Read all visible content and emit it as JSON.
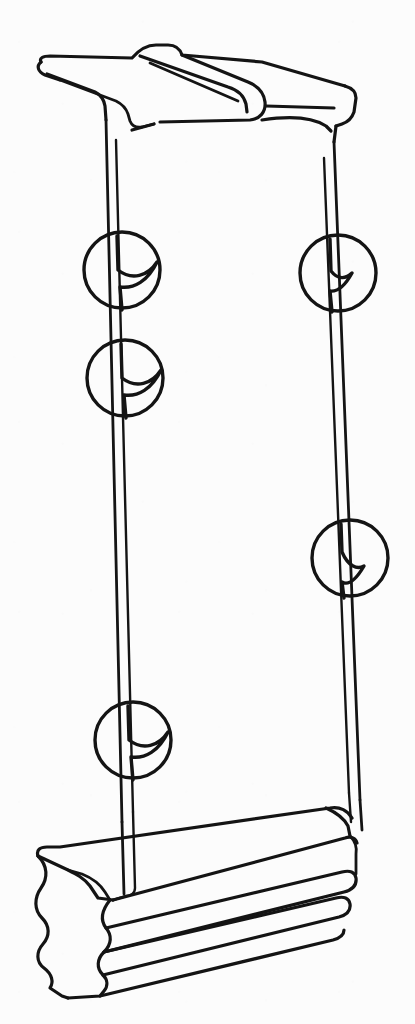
{
  "document": {
    "type": "technical-line-drawing",
    "subject": "architectural column pilaster",
    "title": "",
    "caption": "",
    "background_color": "#fcfcfc",
    "ink_color": "#141414",
    "width_px": 415,
    "height_px": 1024,
    "has_text_labels": false,
    "has_dimensions": false
  },
  "figure": {
    "name": "column-pilaster-perspective",
    "view": "three-quarter perspective",
    "parts": [
      {
        "id": "capital",
        "label": "capital",
        "description": "crown molding top with scrolled roll and projecting abacus",
        "region": {
          "x": 35,
          "y": 42,
          "width": 325,
          "height": 95
        }
      },
      {
        "id": "shaft",
        "label": "shaft",
        "description": "tall plain column shaft with two visible vertical arrises per side",
        "region": {
          "x": 100,
          "y": 120,
          "width": 260,
          "height": 700
        }
      },
      {
        "id": "base",
        "label": "base",
        "description": "stepped plinth base with ogee wavy side profile and three stacked courses",
        "region": {
          "x": 45,
          "y": 815,
          "width": 340,
          "height": 175
        }
      }
    ],
    "break_symbols": [
      {
        "id": "break-upper-left",
        "side": "left",
        "cx": 122,
        "cy": 270,
        "r": 38,
        "orientation": "s-curve-right"
      },
      {
        "id": "break-mid-left",
        "side": "left",
        "cx": 125,
        "cy": 378,
        "r": 38,
        "orientation": "s-curve-right"
      },
      {
        "id": "break-upper-right",
        "side": "right",
        "cx": 338,
        "cy": 273,
        "r": 38,
        "orientation": "z-narrow"
      },
      {
        "id": "break-mid-right",
        "side": "right",
        "cx": 350,
        "cy": 558,
        "r": 38,
        "orientation": "z-narrow"
      },
      {
        "id": "break-lower-left",
        "side": "left",
        "cx": 133,
        "cy": 740,
        "r": 38,
        "orientation": "s-curve-right"
      }
    ],
    "symbol_meaning": "conventional break / continuation mark indicating the shaft continues beyond the drawn length"
  },
  "legend": {
    "visible": false,
    "entries": []
  }
}
